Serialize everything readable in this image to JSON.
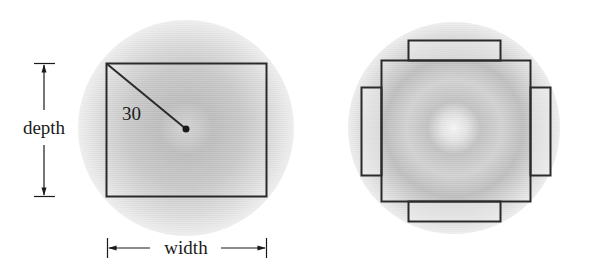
{
  "figure": {
    "left_diagram": {
      "radius_label": "30",
      "depth_label": "depth",
      "width_label": "width",
      "description": "Rectangle inscribed in a circle of radius 30"
    },
    "right_diagram": {
      "description": "Square inscribed in circle with four rectangular flaps on each side"
    },
    "colors": {
      "stroke": "#2a2a2a",
      "circle_light": "#e6e6e6",
      "circle_dark": "#a9a9a9",
      "background": "#ffffff"
    }
  }
}
